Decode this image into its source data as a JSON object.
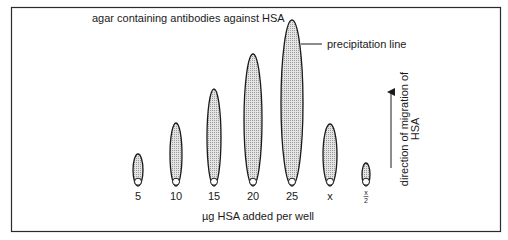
{
  "diagram": {
    "title": "agar containing antibodies against HSA",
    "precipitation_label": "precipitation line",
    "x_axis_label": "µg HSA added per well",
    "direction_label_line1": "direction of migration of",
    "direction_label_line2": "HSA",
    "wells": [
      {
        "label": "5",
        "cx": 138,
        "top": 154,
        "rx": 5
      },
      {
        "label": "10",
        "cx": 176,
        "top": 123,
        "rx": 6
      },
      {
        "label": "15",
        "cx": 214,
        "top": 89,
        "rx": 7
      },
      {
        "label": "20",
        "cx": 253,
        "top": 54,
        "rx": 9
      },
      {
        "label": "25",
        "cx": 292,
        "top": 20,
        "rx": 11
      },
      {
        "label": "x",
        "cx": 330,
        "top": 124,
        "rx": 7
      },
      {
        "label_num": "x",
        "label_den": "2",
        "cx": 366,
        "top": 163,
        "rx": 4
      }
    ],
    "colors": {
      "border": "#2a2a2a",
      "fill": "#d6d6d6",
      "stroke": "#1a1a1a"
    }
  }
}
